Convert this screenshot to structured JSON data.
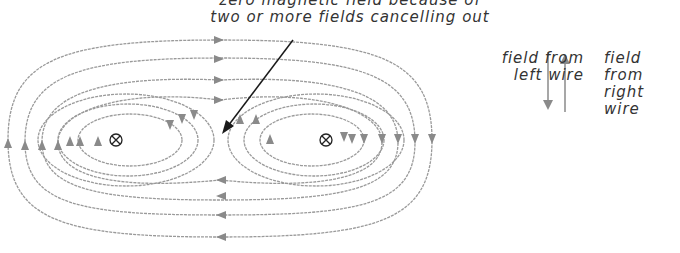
{
  "caption": {
    "line1": "zero magnetic field because of",
    "line2": "two or more fields cancelling out"
  },
  "legend": {
    "left": {
      "line1": "field from",
      "line2": "left wire",
      "direction": "down"
    },
    "right": {
      "line1": "field from",
      "line2": "right wire",
      "direction": "up"
    }
  },
  "wires": [
    {
      "name": "left-wire",
      "symbol": "⊗",
      "x": 116,
      "y": 140
    },
    {
      "name": "right-wire",
      "symbol": "⊗",
      "x": 326,
      "y": 140
    }
  ],
  "colors": {
    "field_line": "#8a8a8a",
    "arrow": "#1a1a1a",
    "text": "#333333"
  }
}
